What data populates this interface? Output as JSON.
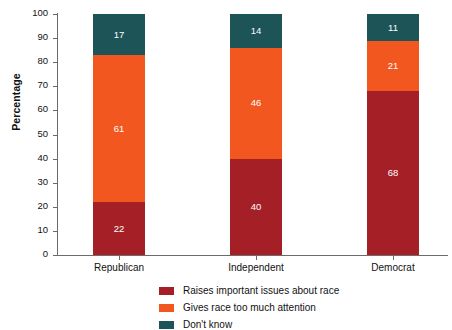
{
  "chart_data": {
    "type": "bar",
    "subtype": "stacked-100-percent",
    "title": "",
    "subtitle": "",
    "xlabel": "",
    "ylabel": "Percentage",
    "ylim": [
      0,
      100
    ],
    "ytick_step": 10,
    "yticks": [
      100,
      90,
      80,
      70,
      60,
      50,
      40,
      30,
      20,
      10,
      0
    ],
    "grid": false,
    "legend_position": "bottom-center",
    "categories": [
      "Republican",
      "Independent",
      "Democrat"
    ],
    "series": [
      {
        "name": "Raises important issues about race",
        "color": "#a51f26",
        "values": [
          22,
          40,
          68
        ]
      },
      {
        "name": "Gives race too much attention",
        "color": "#f1571f",
        "values": [
          61,
          46,
          21
        ]
      },
      {
        "name": "Don't know",
        "color": "#1d5457",
        "values": [
          17,
          14,
          11
        ]
      }
    ]
  },
  "axis": {
    "y_title": "Percentage"
  }
}
